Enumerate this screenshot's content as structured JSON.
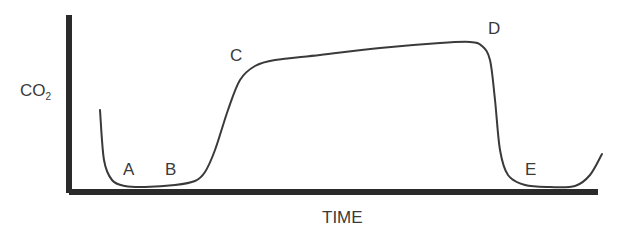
{
  "chart_data": {
    "type": "line",
    "title": "",
    "xlabel": "TIME",
    "ylabel": "CO2",
    "ylabel_main": "CO",
    "ylabel_sub": "2",
    "grid": false,
    "legend": null,
    "annotations": [
      {
        "label": "A",
        "phase": "baseline start"
      },
      {
        "label": "B",
        "phase": "expiratory upstroke start"
      },
      {
        "label": "C",
        "phase": "alveolar plateau start"
      },
      {
        "label": "D",
        "phase": "end-tidal peak"
      },
      {
        "label": "E",
        "phase": "inspiratory downstroke / baseline"
      }
    ],
    "curve_points_px": [
      [
        100,
        110
      ],
      [
        104,
        160
      ],
      [
        112,
        180
      ],
      [
        125,
        186
      ],
      [
        145,
        187
      ],
      [
        175,
        185
      ],
      [
        195,
        181
      ],
      [
        205,
        172
      ],
      [
        215,
        150
      ],
      [
        228,
        110
      ],
      [
        240,
        80
      ],
      [
        255,
        66
      ],
      [
        275,
        60
      ],
      [
        320,
        55
      ],
      [
        380,
        48
      ],
      [
        440,
        43
      ],
      [
        470,
        42
      ],
      [
        482,
        46
      ],
      [
        490,
        60
      ],
      [
        495,
        100
      ],
      [
        500,
        150
      ],
      [
        508,
        175
      ],
      [
        525,
        185
      ],
      [
        550,
        187
      ],
      [
        575,
        186
      ],
      [
        590,
        175
      ],
      [
        602,
        154
      ]
    ]
  },
  "labels": {
    "A": "A",
    "B": "B",
    "C": "C",
    "D": "D",
    "E": "E"
  }
}
